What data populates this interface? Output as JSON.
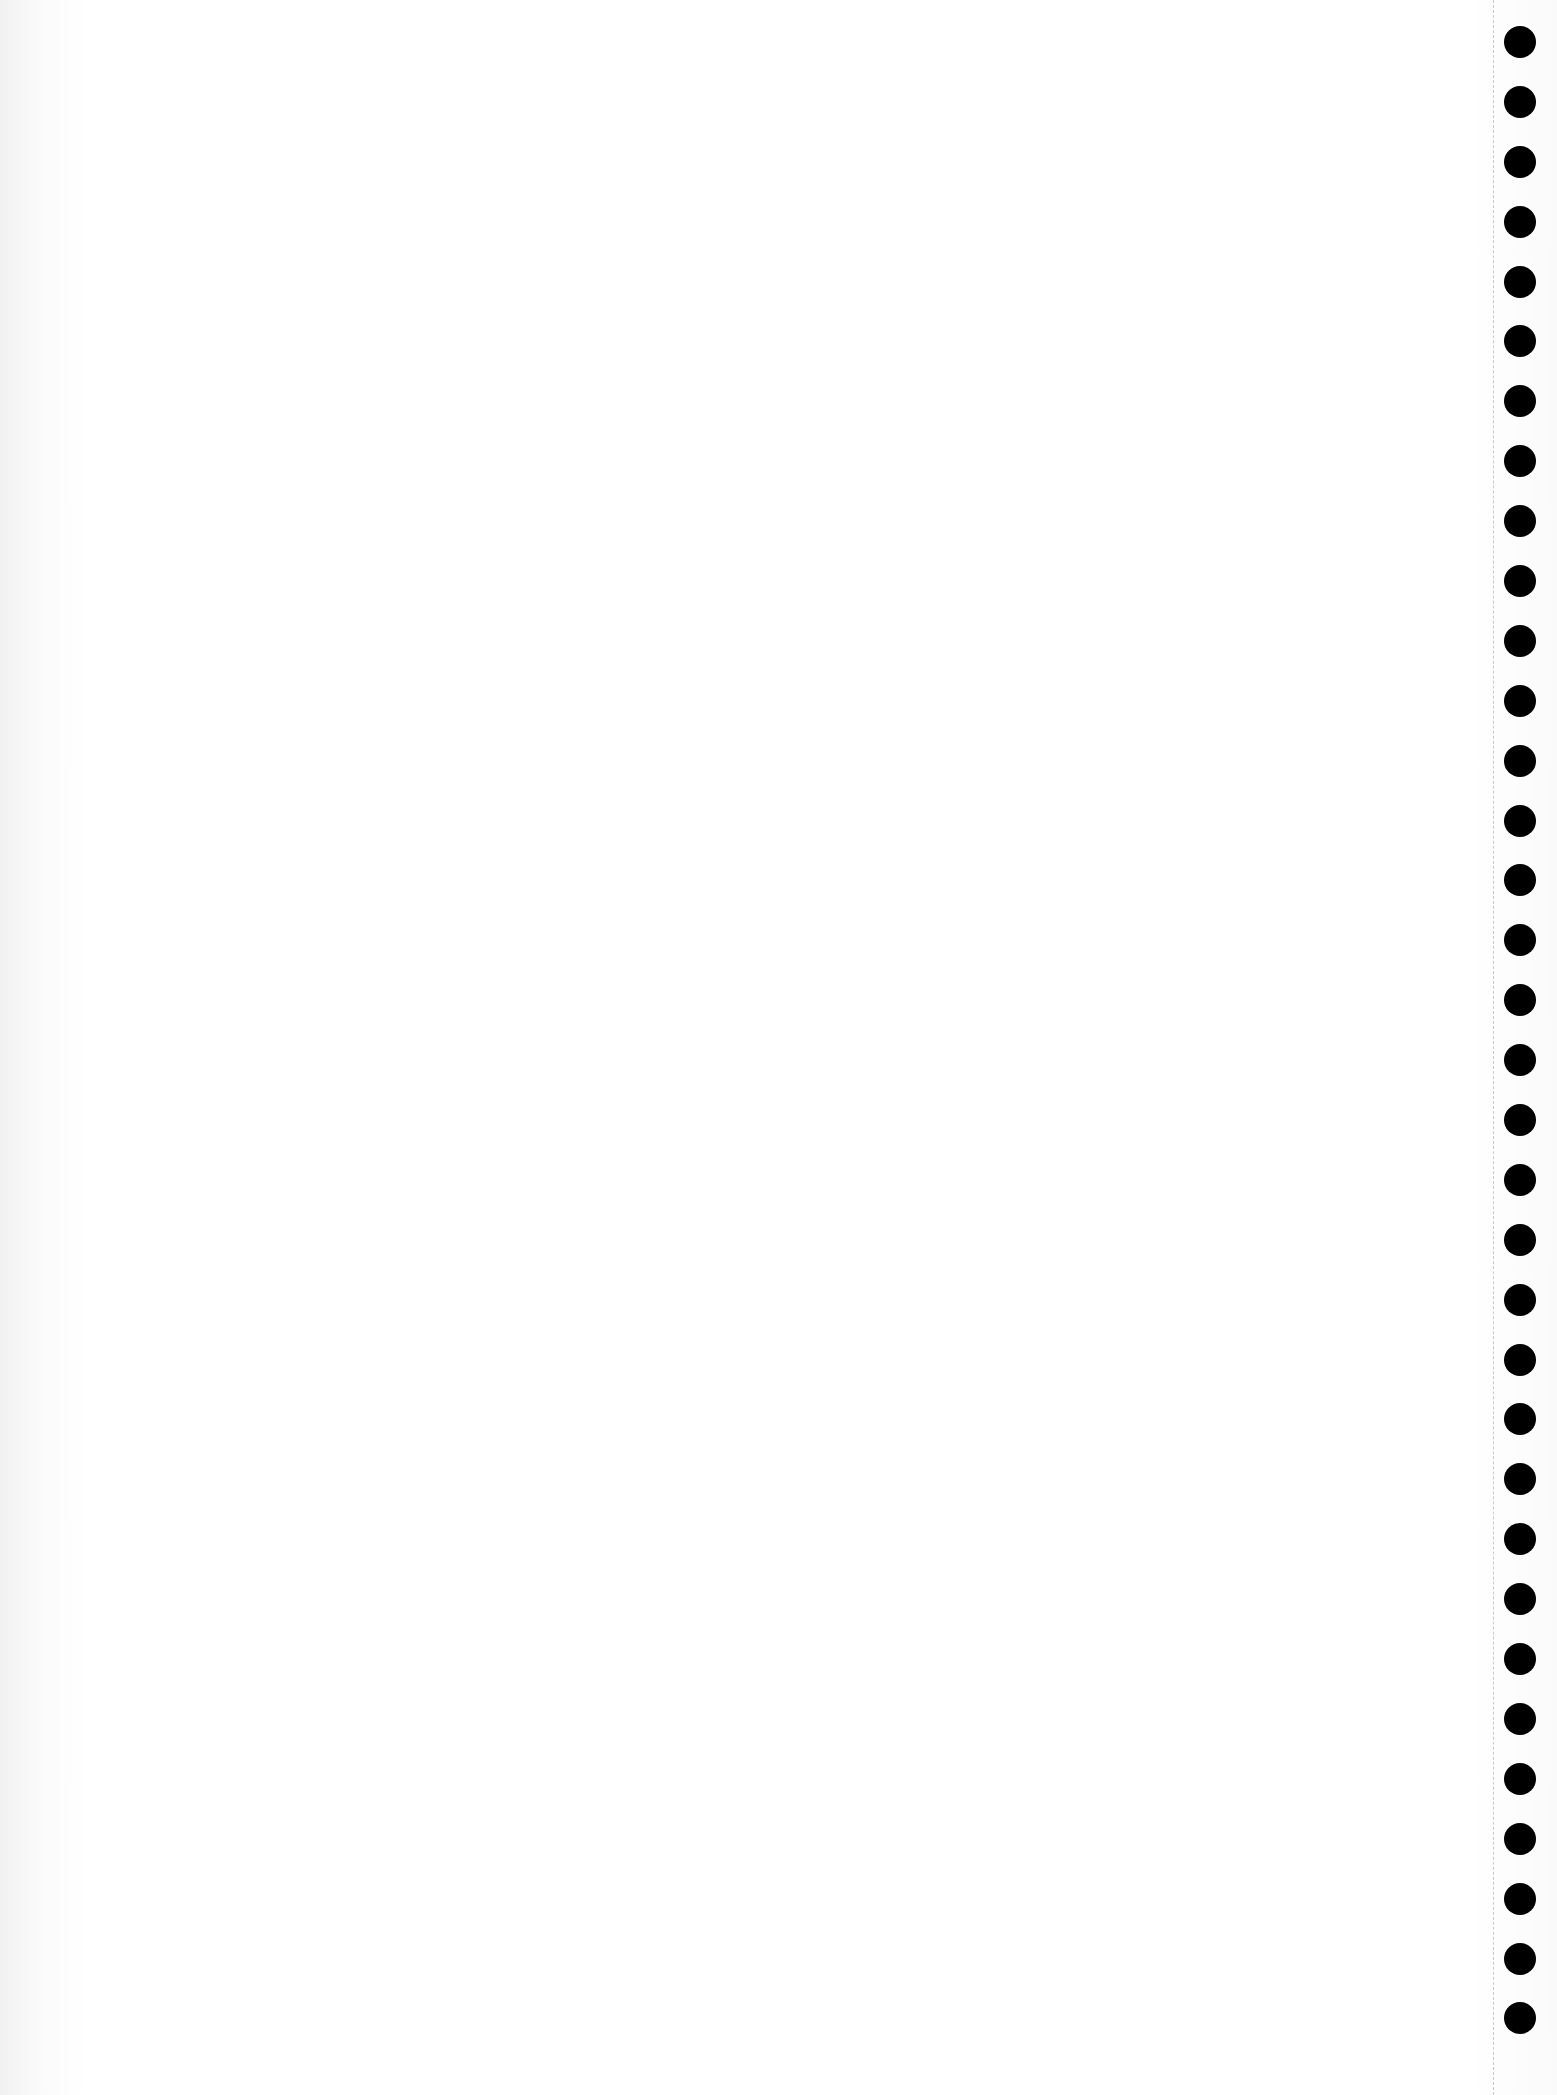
{
  "page": {
    "type": "blank continuous-feed paper scan",
    "background_color": "#ffffff",
    "hole_color": "#000000",
    "hole_count": 34,
    "faint_bleed_through_lines": [
      "",
      ""
    ]
  }
}
